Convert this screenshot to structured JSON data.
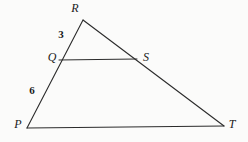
{
  "figure": {
    "kind": "geometry-diagram",
    "width": 248,
    "height": 142,
    "background_color": "#fbfbfa",
    "stroke_color": "#2b2b2b",
    "stroke_width": 1
  },
  "points": [
    {
      "id": "R",
      "label": "R",
      "x": 83,
      "y": 20,
      "label_x": 75,
      "label_y": 8
    },
    {
      "id": "Q",
      "label": "Q",
      "x": 60,
      "y": 60,
      "label_x": 52,
      "label_y": 57
    },
    {
      "id": "S",
      "label": "S",
      "x": 136,
      "y": 59,
      "label_x": 146,
      "label_y": 57
    },
    {
      "id": "P",
      "label": "P",
      "x": 27,
      "y": 128,
      "label_x": 18,
      "label_y": 124
    },
    {
      "id": "T",
      "label": "T",
      "x": 224,
      "y": 126,
      "label_x": 232,
      "label_y": 124
    }
  ],
  "segments": [
    {
      "id": "PR",
      "from": "P",
      "to": "R"
    },
    {
      "id": "RT",
      "from": "R",
      "to": "T"
    },
    {
      "id": "PT",
      "from": "P",
      "to": "T"
    },
    {
      "id": "QS",
      "from": "Q",
      "to": "S"
    }
  ],
  "measurements": [
    {
      "id": "RQ",
      "segment": "R-Q",
      "value": "3",
      "x": 61,
      "y": 34
    },
    {
      "id": "QP",
      "segment": "Q-P",
      "value": "6",
      "x": 32,
      "y": 90
    }
  ]
}
